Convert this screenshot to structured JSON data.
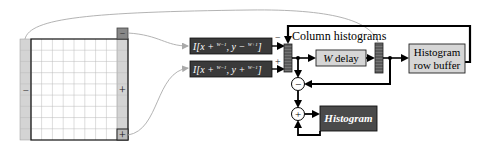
{
  "diagram": {
    "image_window": {
      "left_column_sign": "−",
      "right_column_top_sign": "−",
      "right_column_middle_sign": "+",
      "right_column_bottom_sign": "+"
    },
    "pixel_inputs": [
      {
        "sign": "−",
        "formula": {
          "prefix": "I[x + ",
          "frac1_num": "W−1",
          "frac1_den": "2",
          "mid": ", y − ",
          "frac2_num": "W+1",
          "frac2_den": "2",
          "suffix": "]"
        }
      },
      {
        "sign": "+",
        "formula": {
          "prefix": "I[x + ",
          "frac1_num": "W−1",
          "frac1_den": "2",
          "mid": ", y + ",
          "frac2_num": "W−1",
          "frac2_den": "2",
          "suffix": "]"
        }
      }
    ],
    "labels": {
      "column_histograms": "Column histograms",
      "w_delay_italic": "W",
      "w_delay_text": " delay",
      "row_buffer_line1": "Histogram",
      "row_buffer_line2": "row buffer",
      "histogram": "Histogram",
      "minus_node": "−",
      "plus_node": "+"
    },
    "colors": {
      "dark_box": "#3a3a3a",
      "light_box": "#d6d6d6",
      "column_shade": "#d0d0d0",
      "grid_line": "#b8b8b8",
      "curve": "#aaaaaa",
      "histogram_box": "#4a4a4a"
    }
  }
}
